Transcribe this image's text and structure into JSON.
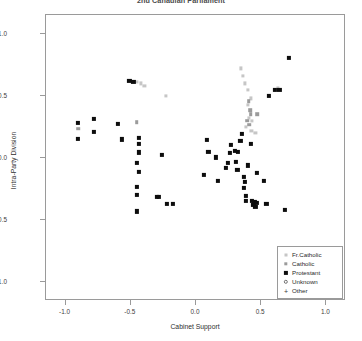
{
  "chart_data": {
    "type": "scatter",
    "title": "2nd Canadian Parliament",
    "xlabel": "Cabinet Support",
    "ylabel": "Intra-Party Division",
    "xlim": [
      -1.15,
      1.15
    ],
    "ylim": [
      -1.15,
      1.15
    ],
    "xticks": [
      -1.0,
      -0.5,
      0.0,
      0.5,
      1.0
    ],
    "xticklabels": [
      "-1.0",
      "-0.5",
      "0.0",
      "0.5",
      "1.0"
    ],
    "yticks": [
      1.0,
      0.5,
      0.0,
      -0.5,
      -1.0
    ],
    "yticklabels": [
      "1.0",
      "0.5",
      "0.0",
      "-0.5",
      "-1.0"
    ],
    "grid": false,
    "legend_position": "bottom-right",
    "legend_entries": [
      {
        "label": "Fr.Catholic",
        "symbol": "small-light-square",
        "color": "#c6c6c6"
      },
      {
        "label": "Catholic",
        "symbol": "small-gray-square",
        "color": "#9b9b9b"
      },
      {
        "label": "Protestant",
        "symbol": "filled-square",
        "color": "#0d0d0d"
      },
      {
        "label": "Unknown",
        "symbol": "open-circle",
        "color": "#6e6e6e"
      },
      {
        "label": "Other",
        "symbol": "plus",
        "color": "#3a3a3a"
      }
    ],
    "series": [
      {
        "name": "Fr.Catholic",
        "color": "#c6c6c6",
        "points": [
          [
            -0.455,
            0.615
          ],
          [
            -0.425,
            0.6
          ],
          [
            -0.395,
            0.58
          ],
          [
            -0.23,
            0.5
          ],
          [
            0.345,
            0.72
          ],
          [
            0.36,
            0.66
          ],
          [
            0.375,
            0.6
          ],
          [
            0.395,
            0.545
          ],
          [
            0.42,
            0.48
          ],
          [
            0.398,
            0.43
          ],
          [
            0.405,
            0.32
          ],
          [
            0.43,
            0.3
          ],
          [
            0.383,
            0.25
          ],
          [
            0.425,
            0.215
          ],
          [
            0.455,
            0.205
          ],
          [
            0.628,
            0.56
          ]
        ]
      },
      {
        "name": "Catholic",
        "color": "#9b9b9b",
        "points": [
          [
            -0.905,
            0.235
          ],
          [
            -0.455,
            0.29
          ],
          [
            0.405,
            0.455
          ],
          [
            0.415,
            0.385
          ],
          [
            0.418,
            0.352
          ],
          [
            0.47,
            0.35
          ],
          [
            0.392,
            0.3
          ],
          [
            0.41,
            0.268
          ]
        ]
      },
      {
        "name": "Protestant",
        "color": "#0d0d0d",
        "points": [
          [
            -0.905,
            0.285
          ],
          [
            -0.905,
            0.155
          ],
          [
            -0.78,
            0.315
          ],
          [
            -0.78,
            0.212
          ],
          [
            -0.51,
            0.62
          ],
          [
            -0.48,
            0.61
          ],
          [
            -0.6,
            0.275
          ],
          [
            -0.565,
            0.15
          ],
          [
            -0.44,
            0.16
          ],
          [
            -0.44,
            0.115
          ],
          [
            -0.44,
            0.045
          ],
          [
            -0.455,
            -0.04
          ],
          [
            -0.44,
            -0.11
          ],
          [
            -0.455,
            -0.23
          ],
          [
            -0.455,
            -0.295
          ],
          [
            -0.455,
            -0.43
          ],
          [
            -0.3,
            -0.31
          ],
          [
            -0.285,
            -0.315
          ],
          [
            -0.225,
            -0.37
          ],
          [
            -0.18,
            -0.37
          ],
          [
            -0.26,
            0.025
          ],
          [
            0.085,
            0.145
          ],
          [
            0.095,
            0.05
          ],
          [
            0.15,
            0.005
          ],
          [
            0.06,
            -0.135
          ],
          [
            0.17,
            -0.185
          ],
          [
            0.23,
            -0.08
          ],
          [
            0.245,
            -0.04
          ],
          [
            0.26,
            0.04
          ],
          [
            0.265,
            0.105
          ],
          [
            0.3,
            0.055
          ],
          [
            0.32,
            0.052
          ],
          [
            0.305,
            -0.03
          ],
          [
            0.318,
            -0.095
          ],
          [
            0.34,
            0.14
          ],
          [
            0.35,
            0.195
          ],
          [
            0.368,
            -0.15
          ],
          [
            0.372,
            -0.195
          ],
          [
            0.368,
            -0.24
          ],
          [
            0.38,
            -0.305
          ],
          [
            0.382,
            -0.345
          ],
          [
            0.395,
            -0.06
          ],
          [
            0.42,
            0.115
          ],
          [
            0.43,
            -0.345
          ],
          [
            0.448,
            -0.35
          ],
          [
            0.44,
            -0.375
          ],
          [
            0.455,
            -0.395
          ],
          [
            0.47,
            -0.36
          ],
          [
            0.47,
            -0.12
          ],
          [
            0.52,
            -0.185
          ],
          [
            0.54,
            -0.37
          ],
          [
            0.56,
            0.5
          ],
          [
            0.605,
            0.545
          ],
          [
            0.64,
            0.545
          ],
          [
            0.68,
            -0.42
          ],
          [
            0.715,
            0.805
          ]
        ]
      },
      {
        "name": "Unknown",
        "color": "#6e6e6e",
        "points": []
      },
      {
        "name": "Other",
        "color": "#3a3a3a",
        "points": []
      }
    ]
  }
}
